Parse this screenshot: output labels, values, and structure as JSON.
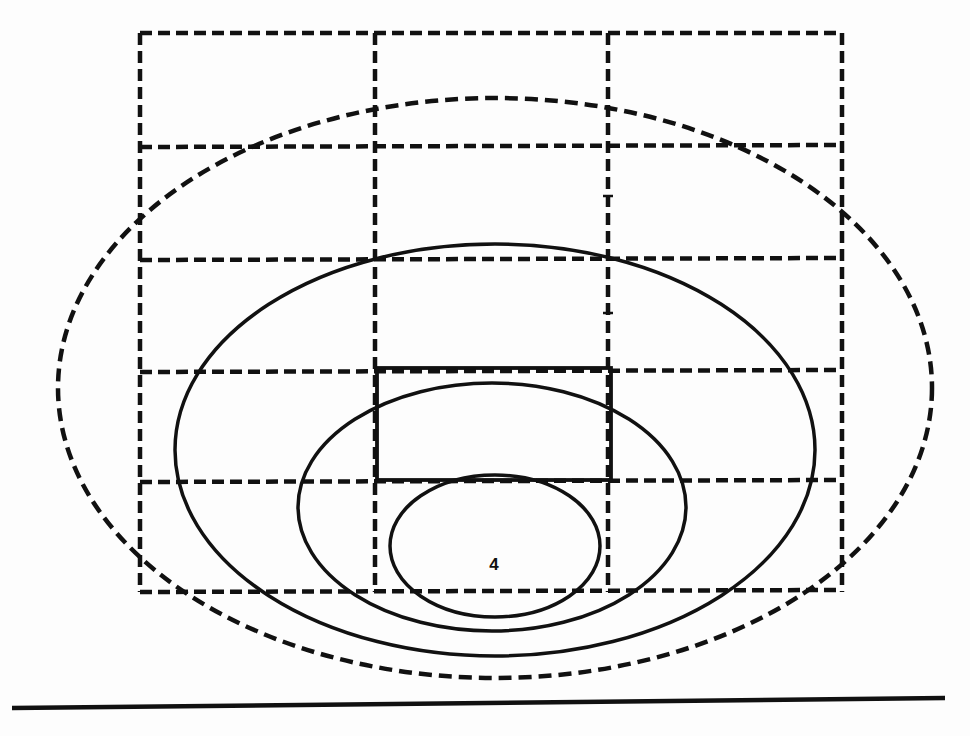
{
  "figure": {
    "background": "#ffffff",
    "ink_color": "#111111",
    "label": "4",
    "label_position": {
      "x": 494,
      "y": 564
    }
  },
  "grid": {
    "style": "dashed",
    "left": 140,
    "right": 842,
    "top": 33,
    "bottom": 592,
    "vertical_lines_x": [
      140,
      375,
      608,
      842
    ],
    "horizontal_lines_y": [
      33,
      147,
      260,
      372,
      482,
      592
    ]
  },
  "solid_rectangle": {
    "x": 377,
    "y": 368,
    "width": 234,
    "height": 112
  },
  "ellipses": [
    {
      "id": "outer-dashed",
      "style": "dashed",
      "cx": 495,
      "cy": 388,
      "rx": 437,
      "ry": 290
    },
    {
      "id": "large-solid",
      "style": "solid",
      "cx": 495,
      "cy": 450,
      "rx": 320,
      "ry": 206
    },
    {
      "id": "medium-solid",
      "style": "solid",
      "cx": 492,
      "cy": 507,
      "rx": 194,
      "ry": 124
    },
    {
      "id": "small-solid",
      "style": "solid",
      "cx": 495,
      "cy": 546,
      "rx": 105,
      "ry": 71
    }
  ],
  "baseline": {
    "x1": 12,
    "y1": 708,
    "x2": 945,
    "y2": 698
  },
  "tick_marks": [
    {
      "x": 608,
      "y": 196
    },
    {
      "x": 608,
      "y": 313
    }
  ]
}
